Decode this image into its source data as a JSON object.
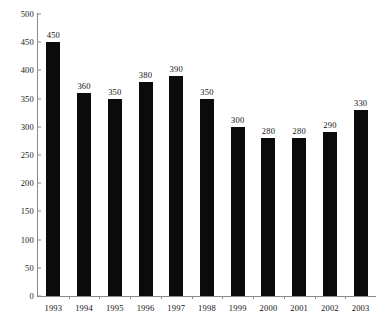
{
  "chart_data": {
    "type": "bar",
    "title": "",
    "subtitle": "",
    "xlabel": "",
    "ylabel": "",
    "categories": [
      "1993",
      "1994",
      "1995",
      "1996",
      "1997",
      "1998",
      "1999",
      "2000",
      "2001",
      "2002",
      "2003"
    ],
    "values": [
      450,
      360,
      350,
      380,
      390,
      350,
      300,
      280,
      280,
      290,
      330
    ],
    "data_labels": [
      "450",
      "360",
      "350",
      "380",
      "390",
      "350",
      "300",
      "280",
      "280",
      "290",
      "330"
    ],
    "ylim": [
      0,
      500
    ],
    "ytick_values": [
      0,
      50,
      100,
      150,
      200,
      250,
      300,
      350,
      400,
      450,
      500
    ],
    "ytick_labels": [
      "0",
      "50",
      "100",
      "150",
      "200",
      "250",
      "300",
      "350",
      "400",
      "450",
      "500"
    ],
    "grid": false,
    "legend": null,
    "bar_color": "#0b0b0b",
    "axis_color": "#8a8a8a",
    "text_color": "#141414",
    "background_color": "#ffffff"
  }
}
